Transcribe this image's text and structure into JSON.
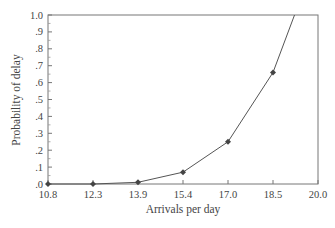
{
  "chart_data": {
    "type": "line",
    "title": "",
    "xlabel": "Arrivals per day",
    "ylabel": "Probability of delay",
    "x_ticks": [
      "10.8",
      "12.3",
      "13.9",
      "15.4",
      "17.0",
      "18.5",
      "20.0"
    ],
    "y_ticks": [
      ".0",
      ".1",
      ".2",
      ".3",
      ".4",
      ".5",
      ".6",
      ".7",
      ".8",
      ".9",
      "1.0"
    ],
    "xlim": [
      10.8,
      20.0
    ],
    "ylim": [
      0.0,
      1.0
    ],
    "grid": false,
    "legend": null,
    "series": [
      {
        "name": "Probability of delay",
        "marker": "diamond",
        "color": "#555555",
        "x": [
          10.8,
          12.3,
          13.9,
          15.4,
          17.0,
          18.5
        ],
        "values": [
          0.0,
          0.0,
          0.01,
          0.07,
          0.25,
          0.66
        ]
      }
    ],
    "curve_extends_to": {
      "x": 19.2,
      "y": 1.0
    }
  },
  "colors": {
    "axis": "#666666",
    "line": "#555555",
    "marker": "#444444",
    "text": "#444444"
  }
}
